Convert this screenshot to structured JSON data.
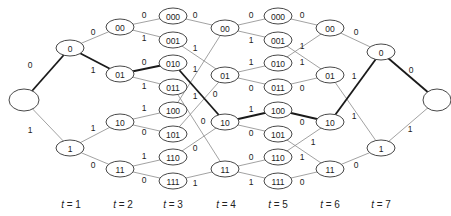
{
  "diagram": {
    "type": "trellis",
    "colors": {
      "edge": "#8a8a8a",
      "bold_edge": "#1a1a1a",
      "node_stroke": "#333333"
    },
    "nodes": [
      {
        "id": "start",
        "label": "",
        "x": 24,
        "y": 100,
        "rx": 15,
        "ry": 11
      },
      {
        "id": "t1_0",
        "label": "0",
        "x": 70,
        "y": 48,
        "rx": 14,
        "ry": 8
      },
      {
        "id": "t1_1",
        "label": "1",
        "x": 70,
        "y": 148,
        "rx": 14,
        "ry": 8
      },
      {
        "id": "t2_00",
        "label": "00",
        "x": 120,
        "y": 27,
        "rx": 14,
        "ry": 8
      },
      {
        "id": "t2_01",
        "label": "01",
        "x": 120,
        "y": 74,
        "rx": 14,
        "ry": 8
      },
      {
        "id": "t2_10",
        "label": "10",
        "x": 120,
        "y": 122,
        "rx": 14,
        "ry": 8
      },
      {
        "id": "t2_11",
        "label": "11",
        "x": 120,
        "y": 169,
        "rx": 14,
        "ry": 8
      },
      {
        "id": "t3_000",
        "label": "000",
        "x": 173,
        "y": 16,
        "rx": 14,
        "ry": 8
      },
      {
        "id": "t3_001",
        "label": "001",
        "x": 173,
        "y": 40,
        "rx": 14,
        "ry": 8
      },
      {
        "id": "t3_010",
        "label": "010",
        "x": 173,
        "y": 63,
        "rx": 14,
        "ry": 8
      },
      {
        "id": "t3_011",
        "label": "011",
        "x": 173,
        "y": 87,
        "rx": 14,
        "ry": 8
      },
      {
        "id": "t3_100",
        "label": "100",
        "x": 173,
        "y": 110,
        "rx": 14,
        "ry": 8
      },
      {
        "id": "t3_101",
        "label": "101",
        "x": 173,
        "y": 134,
        "rx": 14,
        "ry": 8
      },
      {
        "id": "t3_110",
        "label": "110",
        "x": 173,
        "y": 157,
        "rx": 14,
        "ry": 8
      },
      {
        "id": "t3_111",
        "label": "111",
        "x": 173,
        "y": 181,
        "rx": 14,
        "ry": 8
      },
      {
        "id": "t4_00",
        "label": "00",
        "x": 225,
        "y": 28,
        "rx": 14,
        "ry": 8
      },
      {
        "id": "t4_01",
        "label": "01",
        "x": 225,
        "y": 75,
        "rx": 14,
        "ry": 8
      },
      {
        "id": "t4_10",
        "label": "10",
        "x": 225,
        "y": 122,
        "rx": 14,
        "ry": 8
      },
      {
        "id": "t4_11",
        "label": "11",
        "x": 225,
        "y": 169,
        "rx": 14,
        "ry": 8
      },
      {
        "id": "t5_000",
        "label": "000",
        "x": 278,
        "y": 16,
        "rx": 14,
        "ry": 8
      },
      {
        "id": "t5_001",
        "label": "001",
        "x": 278,
        "y": 40,
        "rx": 14,
        "ry": 8
      },
      {
        "id": "t5_010",
        "label": "010",
        "x": 278,
        "y": 63,
        "rx": 14,
        "ry": 8
      },
      {
        "id": "t5_011",
        "label": "011",
        "x": 278,
        "y": 87,
        "rx": 14,
        "ry": 8
      },
      {
        "id": "t5_100",
        "label": "100",
        "x": 278,
        "y": 110,
        "rx": 14,
        "ry": 8
      },
      {
        "id": "t5_101",
        "label": "101",
        "x": 278,
        "y": 134,
        "rx": 14,
        "ry": 8
      },
      {
        "id": "t5_110",
        "label": "110",
        "x": 278,
        "y": 157,
        "rx": 14,
        "ry": 8
      },
      {
        "id": "t5_111",
        "label": "111",
        "x": 278,
        "y": 181,
        "rx": 14,
        "ry": 8
      },
      {
        "id": "t6_00",
        "label": "00",
        "x": 330,
        "y": 28,
        "rx": 14,
        "ry": 8
      },
      {
        "id": "t6_01",
        "label": "01",
        "x": 330,
        "y": 75,
        "rx": 14,
        "ry": 8
      },
      {
        "id": "t6_10",
        "label": "10",
        "x": 330,
        "y": 122,
        "rx": 14,
        "ry": 8
      },
      {
        "id": "t6_11",
        "label": "11",
        "x": 330,
        "y": 169,
        "rx": 14,
        "ry": 8
      },
      {
        "id": "t7_0",
        "label": "0",
        "x": 381,
        "y": 52,
        "rx": 14,
        "ry": 8
      },
      {
        "id": "t7_1",
        "label": "1",
        "x": 381,
        "y": 148,
        "rx": 14,
        "ry": 8
      },
      {
        "id": "end",
        "label": "",
        "x": 437,
        "y": 100,
        "rx": 14,
        "ry": 11
      }
    ],
    "edges": [
      {
        "from": "start",
        "to": "t1_0",
        "label": "0",
        "bold": true,
        "lx": 30,
        "ly": 65
      },
      {
        "from": "start",
        "to": "t1_1",
        "label": "1",
        "bold": false,
        "lx": 30,
        "ly": 130
      },
      {
        "from": "t1_0",
        "to": "t2_00",
        "label": "0",
        "bold": false,
        "lx": 93,
        "ly": 32
      },
      {
        "from": "t1_0",
        "to": "t2_01",
        "label": "1",
        "bold": true,
        "lx": 93,
        "ly": 70
      },
      {
        "from": "t1_1",
        "to": "t2_10",
        "label": "1",
        "bold": false,
        "lx": 93,
        "ly": 128
      },
      {
        "from": "t1_1",
        "to": "t2_11",
        "label": "0",
        "bold": false,
        "lx": 93,
        "ly": 165
      },
      {
        "from": "t2_00",
        "to": "t3_000",
        "label": "0",
        "bold": false,
        "lx": 144,
        "ly": 15
      },
      {
        "from": "t2_00",
        "to": "t3_001",
        "label": "1",
        "bold": false,
        "lx": 144,
        "ly": 38
      },
      {
        "from": "t2_01",
        "to": "t3_010",
        "label": "0",
        "bold": true,
        "lx": 144,
        "ly": 62
      },
      {
        "from": "t2_01",
        "to": "t3_011",
        "label": "1",
        "bold": false,
        "lx": 144,
        "ly": 86
      },
      {
        "from": "t2_10",
        "to": "t3_100",
        "label": "1",
        "bold": false,
        "lx": 144,
        "ly": 108
      },
      {
        "from": "t2_10",
        "to": "t3_101",
        "label": "0",
        "bold": false,
        "lx": 144,
        "ly": 132
      },
      {
        "from": "t2_11",
        "to": "t3_110",
        "label": "1",
        "bold": false,
        "lx": 144,
        "ly": 156
      },
      {
        "from": "t2_11",
        "to": "t3_111",
        "label": "0",
        "bold": false,
        "lx": 144,
        "ly": 180
      },
      {
        "from": "t3_000",
        "to": "t4_00",
        "label": "0",
        "bold": false,
        "lx": 195,
        "ly": 15
      },
      {
        "from": "t3_100",
        "to": "t4_00",
        "label": "1",
        "bold": false,
        "lx": 195,
        "ly": 96
      },
      {
        "from": "t3_001",
        "to": "t4_01",
        "label": "1",
        "bold": false,
        "lx": 195,
        "ly": 48
      },
      {
        "from": "t3_101",
        "to": "t4_01",
        "label": "0",
        "bold": false,
        "lx": 215,
        "ly": 94
      },
      {
        "from": "t3_010",
        "to": "t4_10",
        "label": "1",
        "bold": true,
        "lx": 195,
        "ly": 69
      },
      {
        "from": "t3_110",
        "to": "t4_10",
        "label": "0",
        "bold": false,
        "lx": 195,
        "ly": 148
      },
      {
        "from": "t3_011",
        "to": "t4_11",
        "label": "0",
        "bold": false,
        "lx": 203,
        "ly": 121
      },
      {
        "from": "t3_111",
        "to": "t4_11",
        "label": "1",
        "bold": false,
        "lx": 195,
        "ly": 183
      },
      {
        "from": "t4_00",
        "to": "t5_000",
        "label": "0",
        "bold": false,
        "lx": 251,
        "ly": 15
      },
      {
        "from": "t4_00",
        "to": "t5_001",
        "label": "1",
        "bold": false,
        "lx": 251,
        "ly": 40
      },
      {
        "from": "t4_01",
        "to": "t5_010",
        "label": "1",
        "bold": false,
        "lx": 251,
        "ly": 62
      },
      {
        "from": "t4_01",
        "to": "t5_011",
        "label": "0",
        "bold": false,
        "lx": 251,
        "ly": 88
      },
      {
        "from": "t4_10",
        "to": "t5_100",
        "label": "1",
        "bold": true,
        "lx": 251,
        "ly": 109
      },
      {
        "from": "t4_10",
        "to": "t5_101",
        "label": "0",
        "bold": false,
        "lx": 251,
        "ly": 133
      },
      {
        "from": "t4_11",
        "to": "t5_110",
        "label": "0",
        "bold": false,
        "lx": 251,
        "ly": 157
      },
      {
        "from": "t4_11",
        "to": "t5_111",
        "label": "1",
        "bold": false,
        "lx": 251,
        "ly": 182
      },
      {
        "from": "t5_000",
        "to": "t6_00",
        "label": "0",
        "bold": false,
        "lx": 302,
        "ly": 15
      },
      {
        "from": "t5_100",
        "to": "t6_10",
        "label": "0",
        "bold": true,
        "lx": 302,
        "ly": 122
      },
      {
        "from": "t5_010",
        "to": "t6_00",
        "label": "1",
        "bold": false,
        "lx": 302,
        "ly": 46
      },
      {
        "from": "t5_001",
        "to": "t6_01",
        "label": "1",
        "bold": false,
        "lx": 302,
        "ly": 62
      },
      {
        "from": "t5_011",
        "to": "t6_01",
        "label": "0",
        "bold": false,
        "lx": 302,
        "ly": 88
      },
      {
        "from": "t5_110",
        "to": "t6_10",
        "label": "1",
        "bold": false,
        "lx": 302,
        "ly": 157
      },
      {
        "from": "t5_101",
        "to": "t6_11",
        "label": "1",
        "bold": false,
        "lx": 313,
        "ly": 142
      },
      {
        "from": "t5_111",
        "to": "t6_11",
        "label": "0",
        "bold": false,
        "lx": 302,
        "ly": 182
      },
      {
        "from": "t6_00",
        "to": "t7_0",
        "label": "0",
        "bold": false,
        "lx": 356,
        "ly": 32
      },
      {
        "from": "t6_10",
        "to": "t7_0",
        "label": "1",
        "bold": true,
        "lx": 354,
        "ly": 76
      },
      {
        "from": "t6_01",
        "to": "t7_1",
        "label": "1",
        "bold": false,
        "lx": 354,
        "ly": 116
      },
      {
        "from": "t6_11",
        "to": "t7_1",
        "label": "0",
        "bold": false,
        "lx": 356,
        "ly": 165
      },
      {
        "from": "t7_0",
        "to": "end",
        "label": "0",
        "bold": true,
        "lx": 411,
        "ly": 70
      },
      {
        "from": "t7_1",
        "to": "end",
        "label": "1",
        "bold": false,
        "lx": 410,
        "ly": 129
      }
    ],
    "time_labels": [
      {
        "text": "t = 1",
        "x": 71
      },
      {
        "text": "t = 2",
        "x": 123
      },
      {
        "text": "t = 3",
        "x": 173
      },
      {
        "text": "t = 4",
        "x": 226
      },
      {
        "text": "t = 5",
        "x": 278
      },
      {
        "text": "t = 6",
        "x": 330
      },
      {
        "text": "t = 7",
        "x": 381
      }
    ],
    "time_label_y": 204
  }
}
